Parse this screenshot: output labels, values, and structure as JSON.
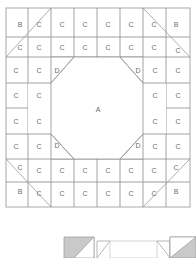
{
  "figure": {
    "type": "quilt-block-piecing-diagram",
    "canvas": {
      "width": 196,
      "height": 258,
      "background": "#ffffff"
    },
    "colors": {
      "line_dark": "#808080",
      "line_light": "#bfbfbf",
      "line_diagonal": "#9a9a9a",
      "frame": "#a8a8a8",
      "label_text": "#6d6d6d",
      "fill_white": "#ffffff",
      "fill_gray": "#c9c9c9",
      "fill_light": "#f2f2f2"
    },
    "piece_labels": {
      "A": "A",
      "B": "B",
      "C": "C",
      "D": "D"
    }
  },
  "main_diagram": {
    "name": "block-layout",
    "frame": {
      "x": 6,
      "y": 8,
      "width": 184,
      "height": 199
    },
    "grid": {
      "cols": 8,
      "rows": 8
    },
    "center_piece": {
      "label": "A",
      "x": 98,
      "y": 108
    },
    "corner_pieces": [
      {
        "label": "B",
        "x": 20,
        "y": 25
      },
      {
        "label": "B",
        "x": 176,
        "y": 25
      },
      {
        "label": "B",
        "x": 20,
        "y": 192
      },
      {
        "label": "B",
        "x": 176,
        "y": 192
      }
    ],
    "corner_triangle_pieces": [
      {
        "label": "D",
        "x": 52,
        "y": 70
      },
      {
        "label": "D",
        "x": 144,
        "y": 70
      },
      {
        "label": "D",
        "x": 52,
        "y": 147
      },
      {
        "label": "D",
        "x": 144,
        "y": 147
      }
    ],
    "square_pieces": [
      {
        "label": "C",
        "x": 39,
        "y": 25
      },
      {
        "label": "C",
        "x": 62,
        "y": 25
      },
      {
        "label": "C",
        "x": 85,
        "y": 25
      },
      {
        "label": "C",
        "x": 108,
        "y": 25
      },
      {
        "label": "C",
        "x": 131,
        "y": 25
      },
      {
        "label": "C",
        "x": 154,
        "y": 25
      },
      {
        "label": "C",
        "x": 20,
        "y": 45
      },
      {
        "label": "C",
        "x": 39,
        "y": 45
      },
      {
        "label": "C",
        "x": 62,
        "y": 45
      },
      {
        "label": "C",
        "x": 85,
        "y": 45
      },
      {
        "label": "C",
        "x": 108,
        "y": 45
      },
      {
        "label": "C",
        "x": 131,
        "y": 45
      },
      {
        "label": "C",
        "x": 154,
        "y": 45
      },
      {
        "label": "C",
        "x": 176,
        "y": 48
      },
      {
        "label": "C",
        "x": 16,
        "y": 70
      },
      {
        "label": "C",
        "x": 39,
        "y": 70
      },
      {
        "label": "C",
        "x": 157,
        "y": 70
      },
      {
        "label": "C",
        "x": 180,
        "y": 70
      },
      {
        "label": "C",
        "x": 16,
        "y": 95
      },
      {
        "label": "C",
        "x": 39,
        "y": 95
      },
      {
        "label": "C",
        "x": 157,
        "y": 95
      },
      {
        "label": "C",
        "x": 180,
        "y": 95
      },
      {
        "label": "C",
        "x": 16,
        "y": 121
      },
      {
        "label": "C",
        "x": 39,
        "y": 121
      },
      {
        "label": "C",
        "x": 157,
        "y": 121
      },
      {
        "label": "C",
        "x": 180,
        "y": 121
      },
      {
        "label": "C",
        "x": 16,
        "y": 147
      },
      {
        "label": "C",
        "x": 39,
        "y": 147
      },
      {
        "label": "C",
        "x": 157,
        "y": 147
      },
      {
        "label": "C",
        "x": 180,
        "y": 147
      },
      {
        "label": "C",
        "x": 20,
        "y": 170
      },
      {
        "label": "C",
        "x": 39,
        "y": 172
      },
      {
        "label": "C",
        "x": 62,
        "y": 172
      },
      {
        "label": "C",
        "x": 85,
        "y": 172
      },
      {
        "label": "C",
        "x": 108,
        "y": 172
      },
      {
        "label": "C",
        "x": 131,
        "y": 172
      },
      {
        "label": "C",
        "x": 154,
        "y": 172
      },
      {
        "label": "C",
        "x": 176,
        "y": 170
      },
      {
        "label": "C",
        "x": 39,
        "y": 192
      },
      {
        "label": "C",
        "x": 62,
        "y": 192
      },
      {
        "label": "C",
        "x": 85,
        "y": 192
      },
      {
        "label": "C",
        "x": 108,
        "y": 192
      },
      {
        "label": "C",
        "x": 131,
        "y": 192
      },
      {
        "label": "C",
        "x": 154,
        "y": 192
      }
    ]
  },
  "secondary_diagram": {
    "name": "assembly-detail",
    "visible_fragment": true,
    "shapes": [
      {
        "name": "left-gray-square",
        "fill": "#c9c9c9"
      },
      {
        "name": "left-white-triangle",
        "fill": "#ffffff"
      },
      {
        "name": "center-white-strip",
        "fill": "#ffffff"
      },
      {
        "name": "right-white-triangle",
        "fill": "#ffffff"
      },
      {
        "name": "right-gray-square",
        "fill": "#c9c9c9"
      }
    ]
  }
}
